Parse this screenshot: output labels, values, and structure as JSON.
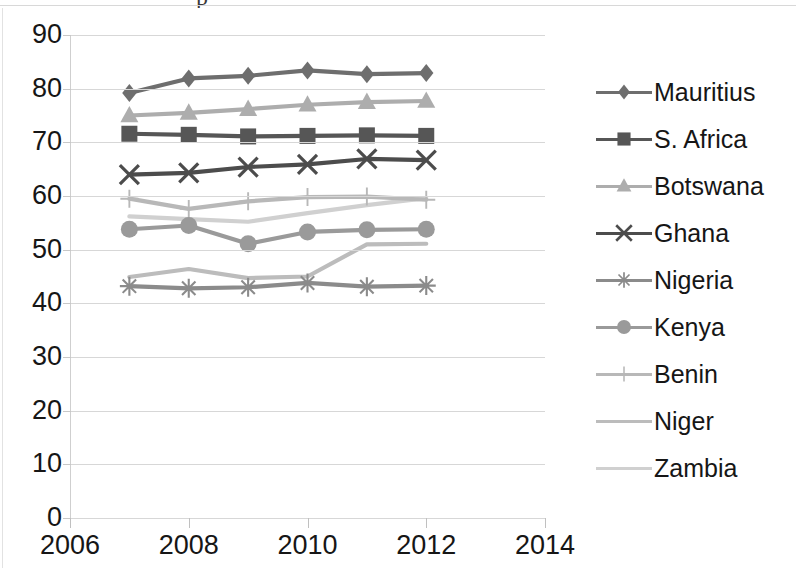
{
  "chart_data": {
    "type": "line",
    "title": "",
    "xlabel": "",
    "ylabel": "",
    "x": [
      2007,
      2008,
      2009,
      2010,
      2011,
      2012
    ],
    "xlim": [
      2006,
      2014
    ],
    "ylim": [
      0,
      90
    ],
    "x_tick_labels": [
      "2006",
      "2008",
      "2010",
      "2012",
      "2014"
    ],
    "x_ticks": [
      2006,
      2008,
      2010,
      2012,
      2014
    ],
    "y_tick_labels": [
      "0",
      "10",
      "20",
      "30",
      "40",
      "50",
      "60",
      "70",
      "80",
      "90"
    ],
    "y_ticks": [
      0,
      10,
      20,
      30,
      40,
      50,
      60,
      70,
      80,
      90
    ],
    "grid": true,
    "legend_position": "right",
    "series": [
      {
        "name": "Mauritius",
        "marker": "diamond",
        "color": "#6e6e6e",
        "values": [
          79.2,
          81.9,
          82.4,
          83.4,
          82.7,
          82.9
        ]
      },
      {
        "name": "S. Africa",
        "marker": "square",
        "color": "#565656",
        "values": [
          71.6,
          71.4,
          71.1,
          71.2,
          71.3,
          71.2
        ]
      },
      {
        "name": "Botswana",
        "marker": "triangle",
        "color": "#adadad",
        "values": [
          75.0,
          75.5,
          76.2,
          77.0,
          77.5,
          77.7
        ]
      },
      {
        "name": "Ghana",
        "marker": "x",
        "color": "#4c4c4c",
        "values": [
          64.0,
          64.3,
          65.4,
          65.9,
          66.9,
          66.7
        ]
      },
      {
        "name": "Nigeria",
        "marker": "asterisk",
        "color": "#8b8b8b",
        "values": [
          43.2,
          42.8,
          43.0,
          43.8,
          43.1,
          43.3
        ]
      },
      {
        "name": "Kenya",
        "marker": "circle",
        "color": "#9a9a9a",
        "values": [
          53.8,
          54.5,
          51.1,
          53.3,
          53.7,
          53.8
        ]
      },
      {
        "name": "Benin",
        "marker": "plus",
        "color": "#b8b8b8",
        "values": [
          59.5,
          57.6,
          59.0,
          59.8,
          59.9,
          59.3
        ]
      },
      {
        "name": "Niger",
        "marker": "none",
        "color": "#bcbcbc",
        "values": [
          44.9,
          46.4,
          44.7,
          45.0,
          51.0,
          51.1
        ]
      },
      {
        "name": "Zambia",
        "marker": "none",
        "color": "#d0d0d0",
        "values": [
          56.2,
          55.7,
          55.2,
          56.8,
          58.3,
          59.6
        ]
      }
    ]
  },
  "title_remnant": "p"
}
